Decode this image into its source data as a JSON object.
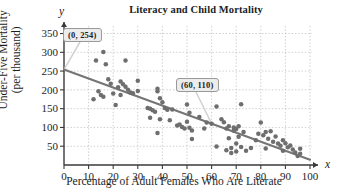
{
  "chart_data": {
    "type": "scatter",
    "title": "Literacy and Child Mortality",
    "xlabel": "Percentage of Adult Females Who Are Literate",
    "ylabel": "Under-Five Mortality\n(per thousand)",
    "ylabel_line1": "Under-Five Mortality",
    "ylabel_line2": "(per thousand)",
    "x_axis_symbol": "x",
    "y_axis_symbol": "y",
    "xlim": [
      0,
      100
    ],
    "ylim": [
      0,
      370
    ],
    "xticks": [
      0,
      10,
      20,
      30,
      40,
      50,
      60,
      70,
      80,
      90,
      100
    ],
    "yticks": [
      50,
      100,
      150,
      200,
      250,
      300,
      350
    ],
    "grid": true,
    "legend": null,
    "point_color": "#6e6e6e",
    "line_color": "#757575",
    "trend_line": {
      "label": "least-squares regression line",
      "points": [
        [
          0,
          254
        ],
        [
          100,
          14
        ]
      ],
      "slope": -2.4,
      "intercept": 254
    },
    "annotations": [
      {
        "text": "(0, 254)",
        "point": [
          0,
          254
        ],
        "box_x": 63,
        "box_y": 28
      },
      {
        "text": "(60, 110)",
        "point": [
          60,
          110
        ],
        "box_x": 176,
        "box_y": 78
      }
    ],
    "points": [
      [
        12,
        175
      ],
      [
        13,
        278
      ],
      [
        14,
        196
      ],
      [
        15,
        186
      ],
      [
        16,
        301
      ],
      [
        16,
        182
      ],
      [
        17,
        268
      ],
      [
        18,
        228
      ],
      [
        19,
        216
      ],
      [
        20,
        190
      ],
      [
        21,
        160
      ],
      [
        22,
        207
      ],
      [
        23,
        222
      ],
      [
        23,
        186
      ],
      [
        24,
        215
      ],
      [
        25,
        208
      ],
      [
        25,
        278
      ],
      [
        26,
        200
      ],
      [
        27,
        193
      ],
      [
        28,
        191
      ],
      [
        30,
        224
      ],
      [
        30,
        197
      ],
      [
        34,
        152
      ],
      [
        35,
        150
      ],
      [
        35,
        126
      ],
      [
        36,
        146
      ],
      [
        37,
        142
      ],
      [
        38,
        203
      ],
      [
        38,
        196
      ],
      [
        38,
        85
      ],
      [
        39,
        178
      ],
      [
        39,
        122
      ],
      [
        40,
        167
      ],
      [
        41,
        152
      ],
      [
        42,
        147
      ],
      [
        43,
        119
      ],
      [
        44,
        148
      ],
      [
        46,
        105
      ],
      [
        47,
        108
      ],
      [
        48,
        101
      ],
      [
        49,
        97
      ],
      [
        50,
        161
      ],
      [
        50,
        115
      ],
      [
        51,
        139
      ],
      [
        51,
        99
      ],
      [
        52,
        92
      ],
      [
        52,
        69
      ],
      [
        55,
        128
      ],
      [
        57,
        97
      ],
      [
        58,
        113
      ],
      [
        60,
        110
      ],
      [
        62,
        156
      ],
      [
        62,
        49
      ],
      [
        64,
        122
      ],
      [
        65,
        114
      ],
      [
        66,
        97
      ],
      [
        66,
        39
      ],
      [
        67,
        103
      ],
      [
        67,
        71
      ],
      [
        68,
        45
      ],
      [
        68,
        32
      ],
      [
        69,
        100
      ],
      [
        69,
        92
      ],
      [
        70,
        96
      ],
      [
        70,
        57
      ],
      [
        70,
        36
      ],
      [
        71,
        103
      ],
      [
        71,
        75
      ],
      [
        72,
        162
      ],
      [
        72,
        48
      ],
      [
        73,
        88
      ],
      [
        74,
        38
      ],
      [
        76,
        45
      ],
      [
        78,
        66
      ],
      [
        79,
        83
      ],
      [
        80,
        113
      ],
      [
        81,
        79
      ],
      [
        82,
        88
      ],
      [
        82,
        44
      ],
      [
        83,
        70
      ],
      [
        84,
        90
      ],
      [
        85,
        62
      ],
      [
        86,
        76
      ],
      [
        87,
        57
      ],
      [
        88,
        51
      ],
      [
        89,
        66
      ],
      [
        89,
        38
      ],
      [
        90,
        58
      ],
      [
        91,
        47
      ],
      [
        92,
        52
      ],
      [
        93,
        41
      ],
      [
        94,
        33
      ],
      [
        95,
        24
      ],
      [
        96,
        43
      ],
      [
        96,
        30
      ]
    ]
  }
}
